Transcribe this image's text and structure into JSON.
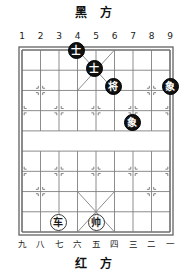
{
  "board": {
    "black_side_label": "黑 方",
    "red_side_label": "红 方",
    "top_coords": [
      "1",
      "2",
      "3",
      "4",
      "5",
      "6",
      "7",
      "8",
      "9"
    ],
    "bottom_coords": [
      "九",
      "八",
      "七",
      "六",
      "五",
      "四",
      "三",
      "二",
      "一"
    ],
    "files": 9,
    "ranks": 10,
    "grid_color": "#808080",
    "border_color": "#6e6e6e",
    "background": "#ffffff"
  },
  "pieces": [
    {
      "id": "black-advisor-1",
      "label": "士",
      "color": "black",
      "file": 4,
      "rank": 1,
      "x": 76,
      "y": 50
    },
    {
      "id": "black-advisor-2",
      "label": "士",
      "color": "black",
      "file": 5,
      "rank": 2,
      "x": 94,
      "y": 68
    },
    {
      "id": "black-general",
      "label": "将",
      "color": "black",
      "file": 6,
      "rank": 3,
      "x": 113,
      "y": 86
    },
    {
      "id": "black-elephant-1",
      "label": "象",
      "color": "black",
      "file": 9,
      "rank": 3,
      "x": 170,
      "y": 86
    },
    {
      "id": "black-elephant-2",
      "label": "象",
      "color": "black",
      "file": 7,
      "rank": 5,
      "x": 132,
      "y": 122
    },
    {
      "id": "red-chariot",
      "label": "车",
      "color": "red",
      "file": 3,
      "rank": 10,
      "x": 58,
      "y": 222
    },
    {
      "id": "red-marshal",
      "label": "帅",
      "color": "red",
      "file": 5,
      "rank": 10,
      "x": 96,
      "y": 222
    }
  ]
}
